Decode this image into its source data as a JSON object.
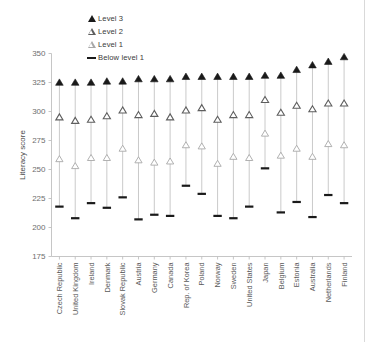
{
  "chart_data": {
    "type": "scatter",
    "title": "",
    "xlabel": "",
    "ylabel": "Literacy score",
    "ylim": [
      175,
      350
    ],
    "ytick_step": 25,
    "yticks": [
      175,
      200,
      225,
      250,
      275,
      300,
      325,
      350
    ],
    "grid": false,
    "legend_position": "top-center",
    "categories": [
      "Czech Republic",
      "United Kingdom",
      "Ireland",
      "Denmark",
      "Slovak Republic",
      "Austria",
      "Germany",
      "Canada",
      "Rep. of Korea",
      "Poland",
      "Norway",
      "Sweden",
      "United States",
      "Japan",
      "Belgium",
      "Estonia",
      "Australia",
      "Netherlands",
      "Finland"
    ],
    "series": [
      {
        "name": "Level 3",
        "marker": "filled-triangle",
        "color": "#1a1a1a",
        "values": [
          325,
          325,
          325,
          326,
          326,
          328,
          328,
          328,
          330,
          330,
          330,
          330,
          330,
          331,
          331,
          336,
          340,
          343,
          347
        ]
      },
      {
        "name": "Level 2",
        "marker": "open-triangle",
        "color": "#5e5e5e",
        "values": [
          295,
          292,
          293,
          296,
          301,
          297,
          298,
          295,
          301,
          303,
          293,
          297,
          297,
          310,
          299,
          305,
          302,
          307,
          307
        ]
      },
      {
        "name": "Level 1",
        "marker": "open-triangle-light",
        "color": "#a8a8a8",
        "values": [
          259,
          253,
          260,
          260,
          268,
          258,
          256,
          257,
          271,
          270,
          255,
          261,
          260,
          281,
          262,
          268,
          261,
          272,
          271
        ]
      },
      {
        "name": "Below level 1",
        "marker": "dash",
        "color": "#1a1a1a",
        "values": [
          218,
          208,
          221,
          217,
          226,
          207,
          211,
          210,
          236,
          229,
          210,
          208,
          218,
          251,
          213,
          222,
          209,
          228,
          221
        ]
      }
    ]
  },
  "legend": {
    "items": [
      {
        "label": "Level 3",
        "marker": "filled-triangle"
      },
      {
        "label": "Level 2",
        "marker": "open-triangle"
      },
      {
        "label": "Level 1",
        "marker": "open-triangle-light"
      },
      {
        "label": "Below level 1",
        "marker": "dash"
      }
    ]
  },
  "axes": {
    "y_title": "Literacy score"
  }
}
